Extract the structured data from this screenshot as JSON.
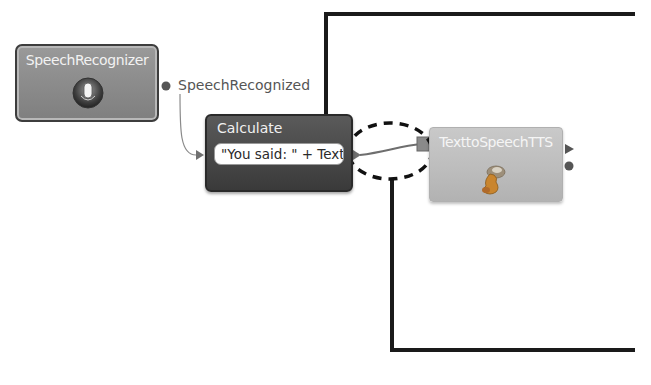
{
  "diagram": {
    "nodes": [
      {
        "id": "speech-recognizer",
        "title": "SpeechRecognizer",
        "icon": "microphone-icon"
      },
      {
        "id": "calculate",
        "title": "Calculate",
        "expression": "\"You said: \" + Text"
      },
      {
        "id": "text-to-speech",
        "title": "TexttoSpeechTTS",
        "icon": "speaker-icon"
      }
    ],
    "ports": {
      "speech_recognized": "SpeechRecognized"
    },
    "annotations": {
      "highlight": "dashed-ellipse around connection between Calculate and TexttoSpeechTTS"
    },
    "colors": {
      "node_dark": "#4a4a4a",
      "node_mid": "#8d8d8d",
      "node_light": "#bdbdbd",
      "callout_line": "#1a1a1a",
      "connector": "#7a7a7a"
    }
  }
}
